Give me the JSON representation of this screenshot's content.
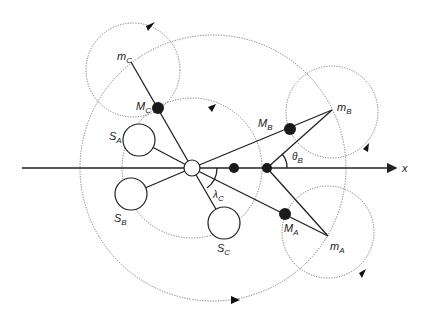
{
  "diagram": {
    "axis_label": "x",
    "labels": {
      "mC": {
        "main": "m",
        "sub": "C"
      },
      "MC": {
        "main": "M",
        "sub": "C"
      },
      "mB": {
        "main": "m",
        "sub": "B"
      },
      "MB": {
        "main": "M",
        "sub": "B"
      },
      "mA": {
        "main": "m",
        "sub": "A"
      },
      "MA": {
        "main": "M",
        "sub": "A"
      },
      "SA": {
        "main": "S",
        "sub": "A"
      },
      "SB": {
        "main": "S",
        "sub": "B"
      },
      "SC": {
        "main": "S",
        "sub": "C"
      },
      "thetaB": {
        "main": "θ",
        "sub": "B"
      },
      "lambdaC": {
        "main": "λ",
        "sub": "C"
      }
    },
    "colors": {
      "line": "#222222",
      "dotted": "#777777",
      "mass": "#1a1a1a",
      "background": "#ffffff"
    }
  }
}
